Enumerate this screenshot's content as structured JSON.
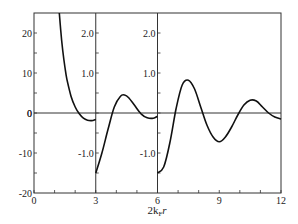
{
  "chart_data": {
    "type": "line",
    "title": "",
    "xlabel": "2k_F r",
    "xlabel_parts": {
      "main": "2k",
      "sub": "F",
      "tail": "r"
    },
    "xlim": [
      0,
      12
    ],
    "x_ticks": [
      "0",
      "3",
      "6",
      "9",
      "12"
    ],
    "grid": false,
    "legend": null,
    "panels": [
      {
        "name": "panel-1",
        "x_range": [
          0,
          3
        ],
        "ylim": [
          -20,
          25
        ],
        "y_ticks": [
          "20",
          "10",
          "0",
          "-10",
          "-20"
        ],
        "y_tick_values": [
          20,
          10,
          0,
          -10,
          -20
        ],
        "series": {
          "x": [
            1.23,
            1.3,
            1.4,
            1.5,
            1.6,
            1.8,
            2.0,
            2.2,
            2.4,
            2.6,
            2.8,
            3.0
          ],
          "y": [
            25,
            20.5,
            15.5,
            11.5,
            8.4,
            4.2,
            1.5,
            -0.2,
            -1.3,
            -1.8,
            -1.9,
            -1.6
          ]
        }
      },
      {
        "name": "panel-2",
        "x_range": [
          3,
          6
        ],
        "ylim": [
          -2.0,
          2.5
        ],
        "y_ticks": [
          "2.0",
          "1.0",
          "-1.0"
        ],
        "y_tick_values": [
          2.0,
          1.0,
          -1.0
        ],
        "series": {
          "x": [
            3.0,
            3.3,
            3.6,
            3.9,
            4.2,
            4.4,
            4.6,
            4.9,
            5.2,
            5.5,
            5.8,
            6.0
          ],
          "y": [
            -1.5,
            -1.0,
            -0.4,
            0.15,
            0.42,
            0.45,
            0.38,
            0.18,
            -0.02,
            -0.12,
            -0.13,
            -0.08
          ]
        }
      },
      {
        "name": "panel-3",
        "x_range": [
          6,
          12
        ],
        "ylim": [
          -2.0,
          2.5
        ],
        "y_ticks": [
          "2.0",
          "1.0",
          "-1.0"
        ],
        "y_tick_values": [
          2.0,
          1.0,
          -1.0
        ],
        "series": {
          "x": [
            6.0,
            6.3,
            6.6,
            6.9,
            7.2,
            7.5,
            7.8,
            8.1,
            8.4,
            8.7,
            9.0,
            9.3,
            9.6,
            9.9,
            10.2,
            10.5,
            10.8,
            11.1,
            11.4,
            11.7,
            12.0
          ],
          "y": [
            -1.5,
            -1.35,
            -0.75,
            0.1,
            0.7,
            0.82,
            0.6,
            0.15,
            -0.3,
            -0.6,
            -0.72,
            -0.6,
            -0.35,
            -0.05,
            0.2,
            0.32,
            0.3,
            0.15,
            0.0,
            -0.1,
            -0.15
          ]
        }
      }
    ]
  }
}
